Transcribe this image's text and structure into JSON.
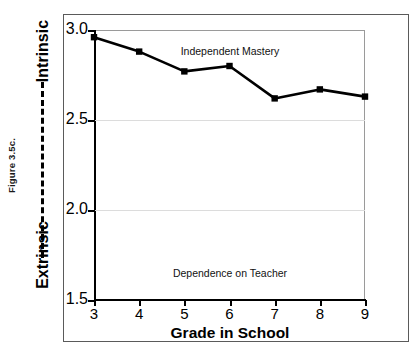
{
  "figure": {
    "caption": "Figure 3.5c."
  },
  "axis_poles": {
    "top_label": "Intrinsic",
    "bottom_label": "Extrinsic",
    "connector": "dashed-line"
  },
  "chart_data": {
    "type": "line",
    "title": "",
    "xlabel": "Grade in School",
    "ylabel": "",
    "x": [
      3,
      4,
      5,
      6,
      7,
      8,
      9
    ],
    "categories": [
      "3",
      "4",
      "5",
      "6",
      "7",
      "8",
      "9"
    ],
    "values": [
      2.96,
      2.88,
      2.77,
      2.8,
      2.62,
      2.67,
      2.63
    ],
    "series": [
      {
        "name": "Motivation orientation",
        "values": [
          2.96,
          2.88,
          2.77,
          2.8,
          2.62,
          2.67,
          2.63
        ]
      }
    ],
    "xlim": [
      3,
      9
    ],
    "ylim": [
      1.5,
      3.0
    ],
    "ytick_labels": [
      "3.0",
      "2.5",
      "2.0",
      "1.5"
    ],
    "ytick_values": [
      3.0,
      2.5,
      2.0,
      1.5
    ],
    "xtick_labels": [
      "3",
      "4",
      "5",
      "6",
      "7",
      "8",
      "9"
    ],
    "grid": true,
    "legend": "none",
    "marker": "square",
    "annotations": [
      {
        "text": "Independent Mastery",
        "position": "top-center"
      },
      {
        "text": "Dependence on Teacher",
        "position": "bottom-center"
      }
    ],
    "colors": {
      "line": "#000000",
      "marker": "#000000",
      "grid": "#dcdcdc",
      "axis": "#000000",
      "background": "#ffffff"
    }
  }
}
